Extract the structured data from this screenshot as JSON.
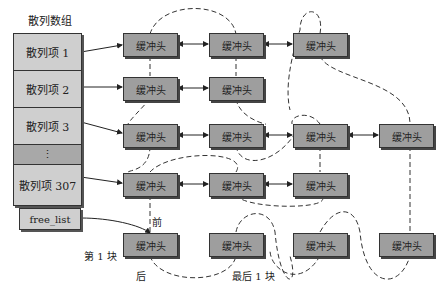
{
  "hash_array": {
    "title": "散列数组",
    "items": [
      "散列项 1",
      "散列项 2",
      "散列项 3",
      "⋮",
      "散列项 307"
    ]
  },
  "free_list": {
    "label": "free_list"
  },
  "buffer_head_label": "缓冲头",
  "labels": {
    "front": "前",
    "back": "后",
    "first_block": "第 1 块",
    "last_block": "最后 1 块"
  },
  "colors": {
    "hash_cell": "#cfcfcf",
    "hash_dots": "#a8a8a8",
    "buffer_head": "#9e9e9e",
    "border": "#333333"
  }
}
